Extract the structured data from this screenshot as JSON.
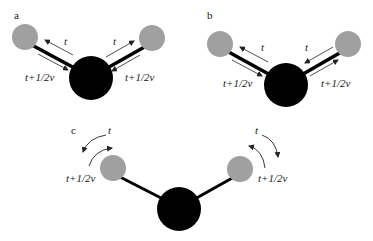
{
  "panels": {
    "a": {
      "label": "a",
      "top_label": "t",
      "bottom_label": "t+1/2v"
    },
    "b": {
      "label": "b",
      "top_label": "t",
      "bottom_label": "t+1/2v"
    },
    "c": {
      "label": "c",
      "top_label": "t",
      "bottom_label": "t+1/2v"
    }
  },
  "colors": {
    "outer_atom": "#a0a0a0",
    "central_atom": "#000000",
    "bond": "#000000",
    "arrow": "#222222"
  }
}
